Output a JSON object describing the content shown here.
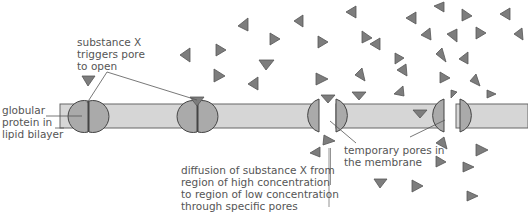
{
  "diagram": {
    "colors": {
      "membrane_fill": "#d6d6d6",
      "membrane_stroke": "#555555",
      "protein_fill": "#a9a9a9",
      "protein_stroke": "#444444",
      "molecule_fill": "#7d7d7d",
      "molecule_stroke": "#555555",
      "label_text": "#555555",
      "leader_line": "#555555"
    },
    "labels": {
      "trigger": "substance X\ntriggers pore\nto open",
      "protein": "globular\nprotein in\nlipid bilayer",
      "diffusion": "diffusion of substance X from\nregion of high concentration\nto region of low concentration\nthrough specific pores",
      "pores": "temporary pores in\nthe membrane"
    },
    "components": [
      "lipid bilayer membrane",
      "closed channel protein (left)",
      "closed channel protein with bound substance X",
      "open pore (centre)",
      "open pore (right)",
      "substance X molecules (triangles)",
      "diffusion direction arrow (downward)"
    ]
  }
}
